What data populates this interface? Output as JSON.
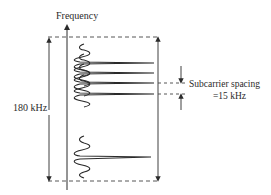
{
  "diagram": {
    "axis_label": "Frequency",
    "bandwidth_label": "180 kHz",
    "spacing_label_line1": "Subcarrier spacing",
    "spacing_label_line2": "=15 kHz",
    "subcarriers_visible_upper": 4,
    "subcarriers_visible_lower": 1,
    "colors": {
      "stroke": "#2a2a2a",
      "dashed": "#444444",
      "background": "#ffffff"
    }
  }
}
